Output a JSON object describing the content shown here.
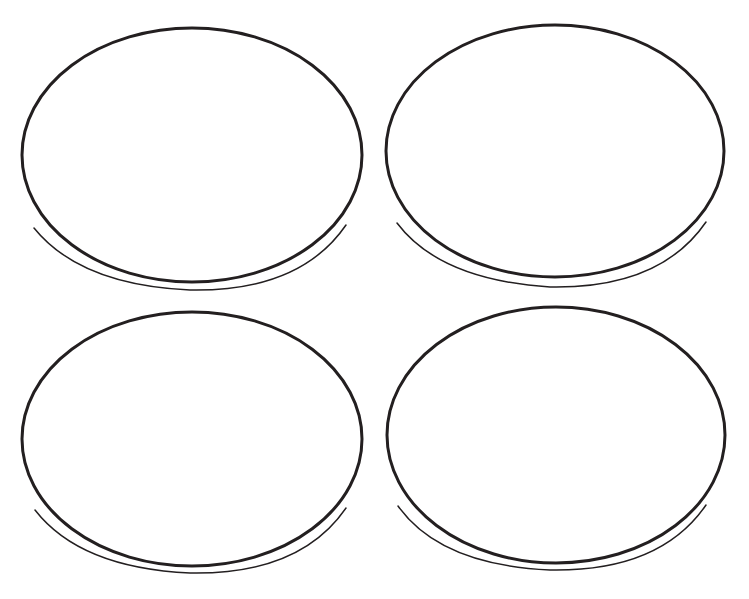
{
  "canvas": {
    "width": 749,
    "height": 599,
    "background": "#ffffff",
    "stroke_color": "#231f20"
  },
  "ellipses": [
    {
      "id": "top-left",
      "main": {
        "cx": 192,
        "cy": 155,
        "rx": 170,
        "ry": 127,
        "stroke_width": 3
      },
      "tail": {
        "d": "M 34 228 Q 80 285 190 290 Q 300 292 346 225",
        "stroke_width": 1.5
      }
    },
    {
      "id": "top-right",
      "main": {
        "cx": 555,
        "cy": 151,
        "rx": 169,
        "ry": 126,
        "stroke_width": 3
      },
      "tail": {
        "d": "M 397 223 Q 440 280 550 287 Q 660 289 706 222",
        "stroke_width": 1.5
      }
    },
    {
      "id": "bottom-left",
      "main": {
        "cx": 192,
        "cy": 439,
        "rx": 170,
        "ry": 127,
        "stroke_width": 3
      },
      "tail": {
        "d": "M 35 510 Q 80 568 190 573 Q 300 575 346 508",
        "stroke_width": 1.5
      }
    },
    {
      "id": "bottom-right",
      "main": {
        "cx": 556,
        "cy": 435,
        "rx": 169,
        "ry": 128,
        "stroke_width": 3
      },
      "tail": {
        "d": "M 398 506 Q 440 565 550 570 Q 660 572 706 505",
        "stroke_width": 1.5
      }
    }
  ]
}
